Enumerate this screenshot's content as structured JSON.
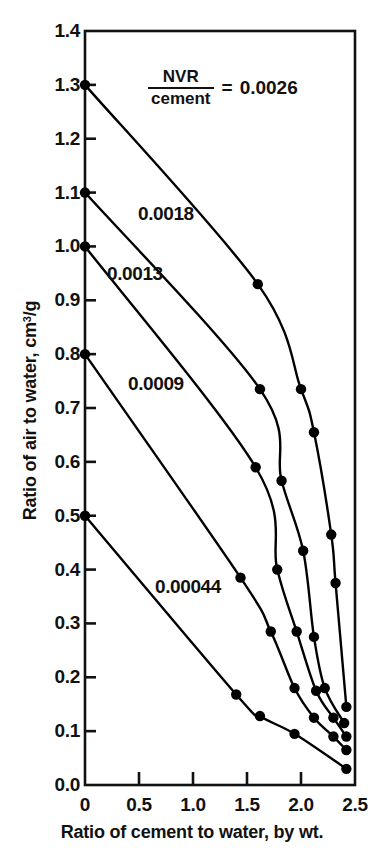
{
  "chart_data": {
    "type": "line",
    "title": "",
    "xlabel": "Ratio of cement to water, by wt.",
    "ylabel": "Ratio of air to water, cm3/g",
    "ylabel_prefix": "Ratio of air to water, cm",
    "ylabel_sup": "3",
    "ylabel_suffix": "/g",
    "xlim": [
      0,
      2.5
    ],
    "ylim": [
      0.0,
      1.4
    ],
    "grid": false,
    "legend": "inline-curve-labels",
    "xticks": [
      0,
      0.5,
      1.0,
      1.5,
      2.0,
      2.5
    ],
    "xtick_labels": [
      "0",
      "0.5",
      "1.0",
      "1.5",
      "2.0",
      "2.5"
    ],
    "yticks": [
      0.0,
      0.1,
      0.2,
      0.3,
      0.4,
      0.5,
      0.6,
      0.7,
      0.8,
      0.9,
      1.0,
      1.1,
      1.2,
      1.3,
      1.4
    ],
    "ytick_labels": [
      "0.0",
      "0.1",
      "0.2",
      "0.3",
      "0.4",
      "0.5",
      "0.6",
      "0.7",
      "0.8",
      "0.9",
      "1.0",
      "1.1",
      "1.2",
      "1.3",
      "1.4"
    ],
    "annotation": {
      "numerator": "NVR",
      "denominator": "cement",
      "equals": "=",
      "value": "0.0026"
    },
    "series": [
      {
        "name": "0.0026",
        "label": "0.0026",
        "label_style": "annotation",
        "color": "#000000",
        "points": [
          {
            "x": 0.0,
            "y": 1.3
          },
          {
            "x": 1.6,
            "y": 0.93
          },
          {
            "x": 2.0,
            "y": 0.735
          },
          {
            "x": 2.12,
            "y": 0.655
          },
          {
            "x": 2.28,
            "y": 0.465
          },
          {
            "x": 2.32,
            "y": 0.375
          },
          {
            "x": 2.42,
            "y": 0.145
          }
        ]
      },
      {
        "name": "0.0018",
        "label": "0.0018",
        "color": "#000000",
        "points": [
          {
            "x": 0.0,
            "y": 1.1
          },
          {
            "x": 1.62,
            "y": 0.735
          },
          {
            "x": 1.82,
            "y": 0.565
          },
          {
            "x": 2.02,
            "y": 0.435
          },
          {
            "x": 2.12,
            "y": 0.275
          },
          {
            "x": 2.22,
            "y": 0.18
          },
          {
            "x": 2.4,
            "y": 0.115
          }
        ]
      },
      {
        "name": "0.0013",
        "label": "0.0013",
        "color": "#000000",
        "points": [
          {
            "x": 0.0,
            "y": 1.0
          },
          {
            "x": 1.58,
            "y": 0.59
          },
          {
            "x": 1.78,
            "y": 0.4
          },
          {
            "x": 1.96,
            "y": 0.285
          },
          {
            "x": 2.14,
            "y": 0.175
          },
          {
            "x": 2.3,
            "y": 0.125
          },
          {
            "x": 2.42,
            "y": 0.09
          }
        ]
      },
      {
        "name": "0.0009",
        "label": "0.0009",
        "color": "#000000",
        "points": [
          {
            "x": 0.0,
            "y": 0.8
          },
          {
            "x": 1.44,
            "y": 0.385
          },
          {
            "x": 1.72,
            "y": 0.285
          },
          {
            "x": 1.94,
            "y": 0.18
          },
          {
            "x": 2.12,
            "y": 0.125
          },
          {
            "x": 2.3,
            "y": 0.09
          },
          {
            "x": 2.42,
            "y": 0.065
          }
        ]
      },
      {
        "name": "0.00044",
        "label": "0.00044",
        "color": "#000000",
        "points": [
          {
            "x": 0.0,
            "y": 0.5
          },
          {
            "x": 1.4,
            "y": 0.168
          },
          {
            "x": 1.62,
            "y": 0.128
          },
          {
            "x": 1.94,
            "y": 0.095
          },
          {
            "x": 2.42,
            "y": 0.03
          }
        ]
      }
    ],
    "curve_label_positions": [
      {
        "label": "0.0018",
        "x_px": 138,
        "y_px": 204
      },
      {
        "label": "0.0013",
        "x_px": 107,
        "y_px": 264
      },
      {
        "label": "0.0009",
        "x_px": 128,
        "y_px": 374
      },
      {
        "label": "0.00044",
        "x_px": 155,
        "y_px": 577
      }
    ]
  }
}
